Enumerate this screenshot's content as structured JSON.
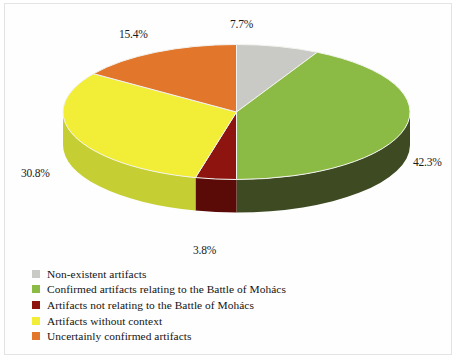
{
  "chart_data": {
    "type": "pie",
    "title": "",
    "subtitle": "",
    "xlabel": "",
    "ylabel": "",
    "grid": false,
    "legend_position": "bottom-left",
    "three_d": true,
    "start_angle_deg": 0,
    "direction": "clockwise",
    "categories": [
      "Non-existent artifacts",
      "Confirmed artifacts relating to the Battle of Mohács",
      "Artifacts not relating to the Battle of Mohács",
      "Artifacts without context",
      "Uncertainly confirmed artifacts"
    ],
    "values": [
      7.7,
      42.3,
      3.8,
      30.8,
      15.4
    ],
    "value_labels": [
      "7.7%",
      "42.3%",
      "3.8%",
      "30.8%",
      "15.4%"
    ],
    "unit": "%",
    "colors": [
      "#c9cac5",
      "#8cbb45",
      "#8e1410",
      "#f2ee38",
      "#e2762b"
    ],
    "side_colors": [
      "#6f706c",
      "#3d4a22",
      "#5a0b08",
      "#c5cf33",
      "#a8511c"
    ]
  },
  "legend": {
    "items": [
      {
        "label": "Non-existent artifacts",
        "color": "#c9cac5"
      },
      {
        "label": "Confirmed artifacts relating to the Battle of Mohács",
        "color": "#8cbb45"
      },
      {
        "label": "Artifacts not relating to the Battle of Mohács",
        "color": "#8e1410"
      },
      {
        "label": "Artifacts without context",
        "color": "#f2ee38"
      },
      {
        "label": "Uncertainly confirmed artifacts",
        "color": "#e2762b"
      }
    ]
  },
  "labels": {
    "grey": "7.7%",
    "green": "42.3%",
    "red": "3.8%",
    "yellow": "30.8%",
    "orange": "15.4%"
  }
}
